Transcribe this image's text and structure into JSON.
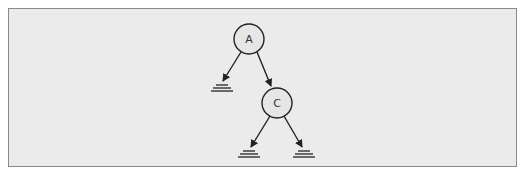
{
  "diagram": {
    "type": "binary-tree",
    "colors": {
      "background": "#ebebeb",
      "frame_border": "#8a8a8a",
      "stroke": "#222222",
      "node_fill": "#e6e6e6"
    },
    "nodes": [
      {
        "id": "A",
        "label": "A",
        "cx": 249,
        "cy": 39,
        "r": 15
      },
      {
        "id": "C",
        "label": "C",
        "cx": 277,
        "cy": 103,
        "r": 15
      }
    ],
    "null_markers": [
      {
        "id": "null-A-left",
        "x": 222,
        "y": 85
      },
      {
        "id": "null-C-left",
        "x": 249,
        "y": 151
      },
      {
        "id": "null-C-right",
        "x": 304,
        "y": 151
      }
    ],
    "edges": [
      {
        "from": "A",
        "to": "null-A-left"
      },
      {
        "from": "A",
        "to": "C"
      },
      {
        "from": "C",
        "to": "null-C-left"
      },
      {
        "from": "C",
        "to": "null-C-right"
      }
    ]
  }
}
